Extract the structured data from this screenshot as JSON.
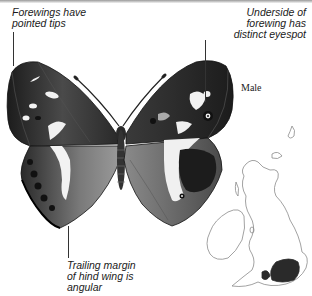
{
  "figure": {
    "sex_label": "Male"
  },
  "callouts": {
    "forewing_tips": "Forewings have\npointed tips",
    "underside_eyespot": "Underside of\nforewing has\ndistinct eyespot",
    "hindwing_margin": "Trailing margin\nof hind wing is\nangular"
  },
  "map": {
    "region": "Britain and Ireland distribution map",
    "shaded_area": "southern England"
  },
  "colors": {
    "ink": "#1a1a1a",
    "wing_dark": "#222222",
    "wing_mid": "#6a6a6a",
    "wing_light": "#f4f4f4",
    "map_outline": "#8a8a8a",
    "map_fill": "#2a2a2a"
  }
}
